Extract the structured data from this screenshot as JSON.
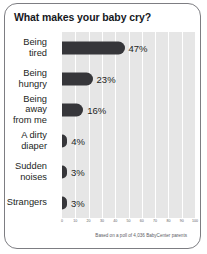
{
  "card": {
    "title": "What makes your baby cry?",
    "footnote": "Based on a poll of 4,036 BabyCenter parents",
    "border_color": "#7d7d82",
    "title_color": "#16181d"
  },
  "chart_data": {
    "type": "bar",
    "orientation": "horizontal",
    "title": "What makes your baby cry?",
    "xlabel": "",
    "ylabel": "",
    "xlim": [
      0,
      100
    ],
    "grid": true,
    "legend": "none",
    "plot_background": "#e6e6e6",
    "bar_color": "#36363a",
    "gridline_color": "#ffffff",
    "categories": [
      "Being\ntired",
      "Being\nhungry",
      "Being\naway\nfrom me",
      "A dirty\ndiaper",
      "Sudden\nnoises",
      "Strangers"
    ],
    "values": [
      47,
      23,
      16,
      4,
      3,
      3
    ],
    "value_labels": [
      "47%",
      "23%",
      "16%",
      "4%",
      "3%",
      "3%"
    ],
    "xticks": [
      0,
      10,
      20,
      30,
      40,
      50,
      60,
      70,
      80,
      90,
      100
    ],
    "xtick_labels": [
      "0",
      "10",
      "20",
      "30",
      "40",
      "50",
      "60",
      "70",
      "80",
      "90",
      "100"
    ]
  }
}
